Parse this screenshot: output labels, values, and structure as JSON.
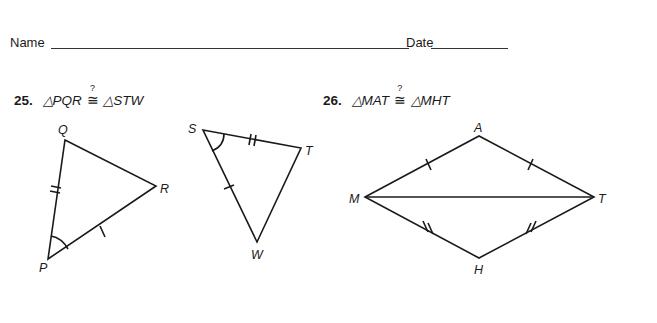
{
  "header": {
    "name_label": "Name",
    "date_label": "Date"
  },
  "problems": [
    {
      "number": "25.",
      "left": "△PQR",
      "relation": "≅",
      "question_mark": "?",
      "right": "△STW",
      "figures": {
        "triangle_1": {
          "vertices": [
            "P",
            "Q",
            "R"
          ],
          "marks": {
            "PQ": "double-tick",
            "PR": "single-tick",
            "angle_P": "arc"
          }
        },
        "triangle_2": {
          "vertices": [
            "S",
            "T",
            "W"
          ],
          "marks": {
            "ST": "double-tick",
            "SW": "single-tick",
            "angle_S": "arc"
          }
        }
      }
    },
    {
      "number": "26.",
      "left": "△MAT",
      "relation": "≅",
      "question_mark": "?",
      "right": "△MHT",
      "figures": {
        "kite": {
          "vertices": [
            "M",
            "A",
            "T",
            "H"
          ],
          "marks": {
            "MA": "single-tick",
            "AT": "single-tick",
            "MH": "double-tick",
            "HT": "double-tick"
          },
          "shared_side": "MT"
        }
      }
    }
  ],
  "labels": {
    "P": "P",
    "Q": "Q",
    "R": "R",
    "S": "S",
    "T1": "T",
    "W": "W",
    "M": "M",
    "A": "A",
    "T2": "T",
    "H": "H"
  }
}
